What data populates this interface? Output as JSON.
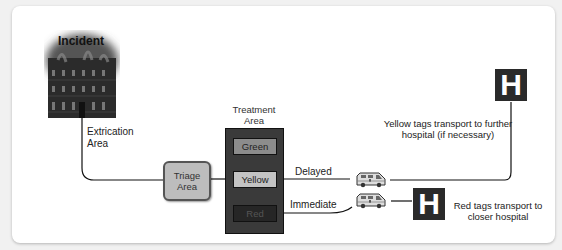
{
  "diagram": {
    "incident": {
      "label": "Incident",
      "icon": "burning-building-icon"
    },
    "extrication": {
      "line1": "Extrication",
      "line2": "Area"
    },
    "triage": {
      "line1": "Triage",
      "line2": "Area"
    },
    "treatment": {
      "label_line1": "Treatment",
      "label_line2": "Area",
      "tags": [
        {
          "label": "Green",
          "color": "#8c8c8c"
        },
        {
          "label": "Yellow",
          "color": "#c3c3c3"
        },
        {
          "label": "Red",
          "color": "#262626"
        }
      ]
    },
    "routes": {
      "delayed": "Delayed",
      "immediate": "Immediate"
    },
    "ambulance_icon": "ambulance-icon",
    "hospitals": {
      "far": {
        "glyph": "H",
        "caption_line1": "Yellow tags transport to further",
        "caption_line2": "hospital (if necessary)"
      },
      "near": {
        "glyph": "H",
        "caption_line1": "Red tags transport to",
        "caption_line2": "closer hospital"
      }
    }
  }
}
